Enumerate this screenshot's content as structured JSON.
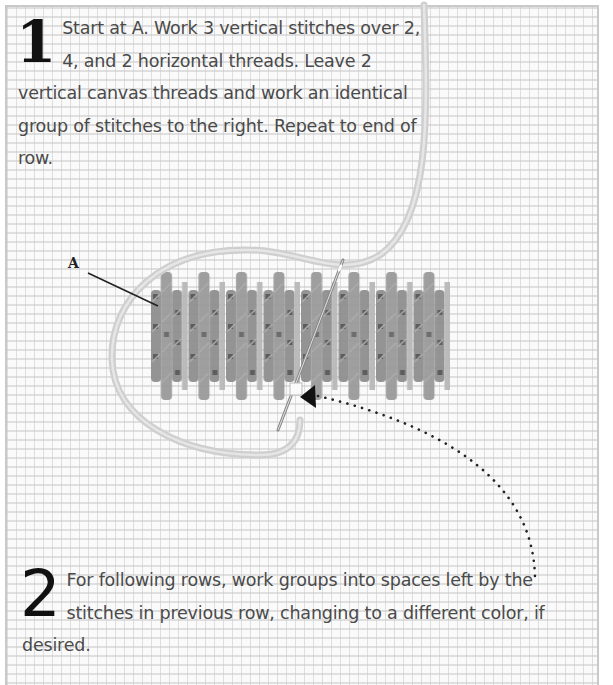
{
  "diagram": {
    "colors": {
      "canvas_background": "#fafafa",
      "canvas_grid": "#c8c8c8",
      "stitch_dark": "#8a8a8a",
      "stitch_light": "#b4b4b4",
      "yarn": "#c8c8c8",
      "text": "#4a4a4a",
      "numeral": "#111111"
    },
    "steps": [
      {
        "number": "1",
        "text": "Start at A. Work 3 vertical stitches over 2, 4, and 2 horizontal threads. Leave 2 vertical canvas threads and work an identical group of stitches to the right. Repeat to end of row."
      },
      {
        "number": "2",
        "text": "For following rows, work groups into spaces left by the stitches in previous row, changing to a different color, if desired."
      }
    ],
    "labels": {
      "start_point": "A"
    },
    "illustration": {
      "stitch_groups": 8,
      "stitch_pattern": [
        2,
        4,
        2
      ],
      "elements": [
        "canvas-grid",
        "stitched-row",
        "yarn-loop",
        "needle",
        "pointer-line-A",
        "dotted-arrow"
      ]
    }
  }
}
